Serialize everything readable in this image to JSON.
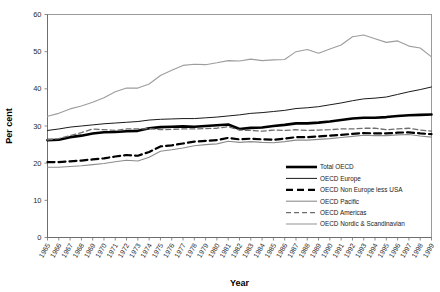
{
  "chart_data": {
    "type": "line",
    "title": "",
    "xlabel": "Year",
    "ylabel": "Per cent",
    "ylim": [
      0,
      60
    ],
    "yticks": [
      0,
      10,
      20,
      30,
      40,
      50,
      60
    ],
    "grid": false,
    "legend_position": "inside-bottom-right",
    "x": [
      1965,
      1966,
      1967,
      1968,
      1969,
      1970,
      1971,
      1972,
      1973,
      1974,
      1975,
      1976,
      1977,
      1978,
      1979,
      1980,
      1981,
      1982,
      1983,
      1984,
      1985,
      1986,
      1987,
      1988,
      1989,
      1990,
      1991,
      1992,
      1993,
      1994,
      1995,
      1996,
      1997,
      1998,
      1999
    ],
    "categories": [
      "1965",
      "1966",
      "1967",
      "1968",
      "1969",
      "1970",
      "1971",
      "1972",
      "1973",
      "1974",
      "1975",
      "1976",
      "1977",
      "1978",
      "1979",
      "1980",
      "1981",
      "1982",
      "1983",
      "1984",
      "1985",
      "1986",
      "1987",
      "1988",
      "1989",
      "1990",
      "1991",
      "1992",
      "1993",
      "1994",
      "1995",
      "1996",
      "1997",
      "1998",
      "1999"
    ],
    "series": [
      {
        "name": "Total OECD",
        "style": "solid-thick",
        "color": "#000000",
        "width": 2.6,
        "dash": "none",
        "values": [
          26.2,
          26.3,
          27.0,
          27.4,
          28.0,
          28.3,
          28.4,
          28.6,
          28.7,
          29.4,
          29.7,
          29.8,
          29.9,
          29.8,
          30.0,
          30.2,
          30.4,
          29.2,
          29.5,
          29.6,
          30.0,
          30.3,
          30.7,
          30.7,
          30.9,
          31.2,
          31.6,
          32.0,
          32.2,
          32.2,
          32.4,
          32.7,
          32.9,
          33.0,
          33.1
        ]
      },
      {
        "name": "OECD Europe",
        "style": "solid-thin",
        "color": "#1a1a1a",
        "width": 1.0,
        "dash": "none",
        "values": [
          28.8,
          29.2,
          29.7,
          30.0,
          30.3,
          30.6,
          30.8,
          31.0,
          31.2,
          31.6,
          31.8,
          31.9,
          32.0,
          32.0,
          32.2,
          32.4,
          32.7,
          33.0,
          33.4,
          33.6,
          33.9,
          34.2,
          34.7,
          34.9,
          35.2,
          35.7,
          36.2,
          36.8,
          37.3,
          37.5,
          37.8,
          38.5,
          39.2,
          39.8,
          40.5
        ]
      },
      {
        "name": "OECD Non Europe less USA",
        "style": "dashed-thick",
        "color": "#000000",
        "width": 2.2,
        "dash": "7,4",
        "values": [
          20.3,
          20.3,
          20.5,
          20.7,
          21.0,
          21.3,
          21.8,
          22.2,
          22.0,
          23.0,
          24.5,
          24.8,
          25.3,
          25.8,
          26.0,
          26.2,
          26.8,
          26.4,
          26.6,
          26.4,
          26.3,
          26.6,
          27.0,
          27.0,
          27.2,
          27.4,
          27.6,
          27.9,
          28.1,
          28.0,
          28.0,
          28.2,
          28.3,
          28.0,
          27.8
        ]
      },
      {
        "name": "OECD Pacific",
        "style": "solid-thin-grey",
        "color": "#8c8c8c",
        "width": 1.1,
        "dash": "none",
        "values": [
          18.9,
          18.9,
          19.1,
          19.3,
          19.6,
          19.9,
          20.4,
          20.8,
          20.6,
          21.6,
          23.2,
          23.6,
          24.1,
          24.7,
          25.0,
          25.2,
          25.9,
          25.6,
          25.8,
          25.6,
          25.5,
          25.8,
          26.2,
          26.2,
          26.4,
          26.6,
          26.9,
          27.2,
          27.5,
          27.4,
          27.4,
          27.6,
          27.7,
          27.3,
          27.0
        ]
      },
      {
        "name": "OECD Americas",
        "style": "dashed-thin",
        "color": "#6e6e6e",
        "width": 1.3,
        "dash": "5,3",
        "values": [
          26.3,
          26.6,
          27.4,
          28.2,
          29.2,
          29.0,
          28.8,
          29.2,
          29.2,
          29.3,
          29.0,
          29.1,
          29.2,
          29.2,
          29.3,
          29.4,
          29.8,
          28.9,
          28.8,
          28.6,
          28.9,
          28.8,
          29.0,
          28.8,
          28.9,
          29.0,
          29.2,
          29.2,
          29.4,
          29.4,
          29.0,
          29.2,
          29.4,
          28.9,
          28.6
        ]
      },
      {
        "name": "OECD Nordic & Scandinavian",
        "style": "solid-thin-light",
        "color": "#9d9d9d",
        "width": 1.1,
        "dash": "none",
        "values": [
          32.6,
          33.4,
          34.6,
          35.4,
          36.4,
          37.6,
          39.2,
          40.2,
          40.2,
          41.3,
          43.6,
          45.0,
          46.3,
          46.6,
          46.5,
          47.0,
          47.6,
          47.5,
          48.0,
          47.6,
          47.8,
          47.9,
          50.0,
          50.6,
          49.6,
          50.7,
          51.8,
          54.0,
          54.5,
          53.5,
          52.5,
          52.9,
          51.5,
          51.0,
          48.6
        ]
      }
    ]
  },
  "axes": {
    "y_label": "Per cent",
    "x_label": "Year"
  },
  "legend": {
    "items": [
      {
        "label": "Total OECD"
      },
      {
        "label": "OECD Europe"
      },
      {
        "label": "OECD Non Europe less USA"
      },
      {
        "label": "OECD Pacific"
      },
      {
        "label": "OECD Americas"
      },
      {
        "label": "OECD Nordic & Scandinavian"
      }
    ]
  }
}
